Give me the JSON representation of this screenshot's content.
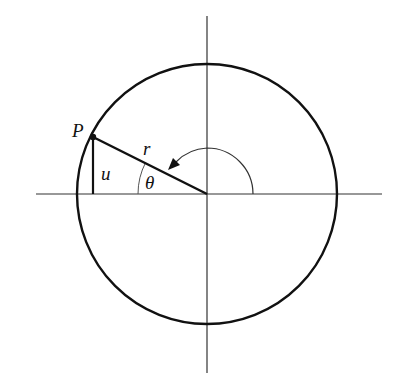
{
  "diagram": {
    "type": "unit-circle-polar",
    "colors": {
      "stroke": "#111111",
      "background": "#ffffff"
    },
    "center": {
      "x": 207,
      "y": 194
    },
    "radius": 130,
    "labels": {
      "point": "P",
      "radius": "r",
      "vertical_leg": "u",
      "angle": "θ"
    },
    "elements": [
      "horizontal-axis",
      "vertical-axis",
      "circle",
      "radius-segment-to-P",
      "vertical-segment-u",
      "point-P-dot",
      "angle-theta-arc",
      "rotation-arrow-arc"
    ]
  }
}
